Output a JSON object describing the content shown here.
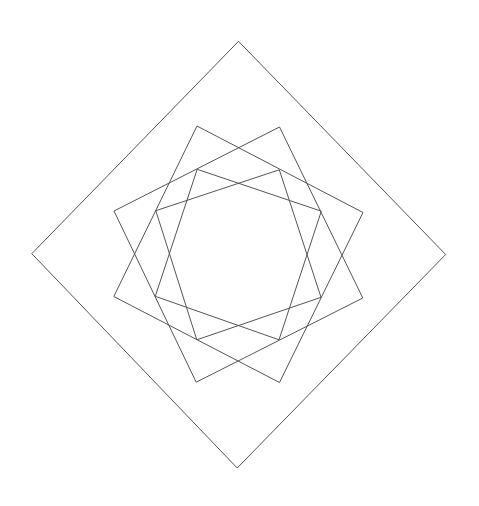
{
  "canvas": {
    "width": 479,
    "height": 506,
    "background": "#ffffff"
  },
  "style": {
    "stroke_color": "#555555",
    "stroke_width": 1
  },
  "shapes": [
    {
      "name": "outer-diamond",
      "type": "square",
      "points": [
        [
          238.5,
          41.3
        ],
        [
          445.7,
          254.5
        ],
        [
          237.2,
          468.0
        ],
        [
          31.8,
          253.7
        ]
      ]
    },
    {
      "name": "middle-square-a",
      "type": "square",
      "points": [
        [
          197,
          126
        ],
        [
          363,
          212.5
        ],
        [
          279.5,
          382.5
        ],
        [
          113.8,
          296.5
        ]
      ]
    },
    {
      "name": "middle-square-b",
      "type": "square",
      "points": [
        [
          279.5,
          127
        ],
        [
          362.8,
          298
        ],
        [
          196.2,
          382.2
        ],
        [
          114,
          211
        ]
      ]
    },
    {
      "name": "inner-square-a",
      "type": "square",
      "points": [
        [
          197.2,
          169.3
        ],
        [
          321.3,
          211.2
        ],
        [
          279,
          339.8
        ],
        [
          155.3,
          296.3
        ]
      ]
    },
    {
      "name": "inner-square-b",
      "type": "square",
      "points": [
        [
          279.3,
          169.8
        ],
        [
          321,
          297.3
        ],
        [
          196.8,
          339.8
        ],
        [
          155.8,
          210.7
        ]
      ]
    }
  ]
}
